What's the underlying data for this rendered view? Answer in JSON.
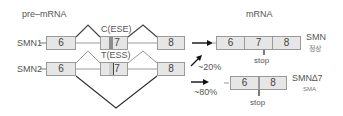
{
  "labels": {
    "pre_mrna": "pre–mRNA",
    "mrna": "mRNA"
  },
  "smn1": {
    "gene": "SMN1",
    "exons": [
      "6",
      "7",
      "8"
    ],
    "site_label": "C(ESE)",
    "product": {
      "exons": [
        "6",
        "7",
        "8"
      ],
      "name": "SMN",
      "status": "정상",
      "stop_label": "stop"
    }
  },
  "smn2": {
    "gene": "SMN2",
    "exons": [
      "6",
      "7",
      "8"
    ],
    "site_label": "T(ESS)",
    "inclusion_pct": "20%",
    "skipping_pct": "80%",
    "product": {
      "exons": [
        "6",
        "8"
      ],
      "name": "SMN∆7",
      "status": "SMA",
      "stop_label": "stop"
    }
  },
  "colors": {
    "exon_fill": "#e6e6e6",
    "exon_border": "#9a9a9a",
    "site_stripe": "#8c8c8c",
    "line": "#444444",
    "text": "#555555"
  }
}
